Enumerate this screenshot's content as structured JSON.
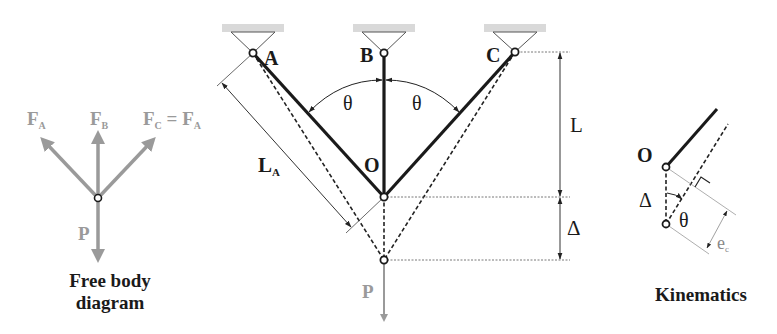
{
  "free_body": {
    "forces": {
      "fa": {
        "main": "F",
        "sub": "A"
      },
      "fb": {
        "main": "F",
        "sub": "B"
      },
      "fc": {
        "main": "F",
        "sub": "C",
        "eq": " = F",
        "eq_sub": "A"
      },
      "p": "P"
    },
    "caption_line1": "Free body",
    "caption_line2": "diagram"
  },
  "truss": {
    "supports": [
      "A",
      "B",
      "C"
    ],
    "center_joint": "O",
    "angle_left": "θ",
    "angle_right": "θ",
    "length_label": {
      "main": "L",
      "sub": "A"
    },
    "vertical_length": "L",
    "displacement": "Δ",
    "load": "P"
  },
  "kinematics": {
    "joint": "O",
    "displacement": "Δ",
    "angle": "θ",
    "elongation": {
      "main": "e",
      "sub": "c"
    },
    "caption": "Kinematics"
  },
  "colors": {
    "member": "#1a1a1a",
    "force_grey": "#9a9a9a",
    "support_fill": "#d9d9d9"
  }
}
